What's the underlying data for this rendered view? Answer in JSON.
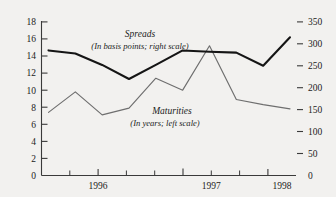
{
  "chart_data": {
    "type": "line",
    "title": "",
    "xlabel": "",
    "grid": false,
    "legend_position": "inline-annotations",
    "x": [
      "1995Q4",
      "1996Q1",
      "1996Q2",
      "1996Q3",
      "1996Q4",
      "1997Q1",
      "1997Q2",
      "1997Q3",
      "1997Q4",
      "1998Q1"
    ],
    "x_tick_labels": [
      "1996",
      "1997",
      "1998"
    ],
    "left_axis": {
      "label": "Maturities (In years; left scale)",
      "ylim": [
        0,
        18
      ],
      "ticks": [
        0,
        2,
        4,
        6,
        8,
        10,
        12,
        14,
        16,
        18
      ],
      "tick_labels": [
        "0",
        "2",
        "4",
        "6",
        "8",
        "10",
        "12",
        "14",
        "16",
        "18"
      ]
    },
    "right_axis": {
      "label": "Spreads (In basis points; right scale)",
      "ylim": [
        0,
        350
      ],
      "ticks": [
        0,
        50,
        100,
        150,
        200,
        250,
        300,
        350
      ],
      "tick_labels": [
        "0",
        "50",
        "100",
        "150",
        "200",
        "250",
        "300",
        "350"
      ]
    },
    "series": [
      {
        "name": "Spreads",
        "axis": "right",
        "unit": "basis points",
        "color": "#151515",
        "values": [
          285,
          278,
          252,
          220,
          252,
          285,
          282,
          280,
          250,
          315
        ]
      },
      {
        "name": "Maturities",
        "axis": "left",
        "unit": "years",
        "color": "#6e6e6e",
        "values": [
          7.4,
          9.8,
          7.1,
          7.9,
          11.4,
          10.0,
          15.2,
          8.9,
          8.3,
          7.8
        ]
      }
    ],
    "annotations": [
      {
        "name": "spreads-label",
        "title": "Spreads",
        "subtitle": "(In basis points; right scale)"
      },
      {
        "name": "maturities-label",
        "title": "Maturities",
        "subtitle": "(In years; left scale)"
      }
    ]
  },
  "axes": {
    "left_ticks": [
      "18",
      "16",
      "14",
      "12",
      "10",
      "8",
      "6",
      "4",
      "2",
      "0"
    ],
    "right_ticks": [
      "350",
      "300",
      "250",
      "200",
      "150",
      "100",
      "50",
      "0"
    ],
    "x_ticks": [
      "1996",
      "1997",
      "1998"
    ]
  },
  "labels": {
    "spreads_title": "Spreads",
    "spreads_sub": "(In basis points; right scale)",
    "maturities_title": "Maturities",
    "maturities_sub": "(In years; left scale)"
  },
  "colors": {
    "background": "#f2f1ef",
    "axis": "#3a3a3a",
    "spreads": "#151515",
    "maturities": "#6e6e6e",
    "text": "#1c1c1c"
  }
}
